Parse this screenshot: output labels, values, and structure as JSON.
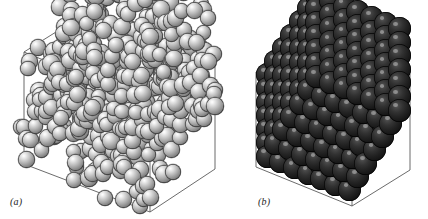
{
  "figure": {
    "background_color": "#ffffff",
    "width": 428,
    "height": 219,
    "caption_style": "italic-serif"
  },
  "panels": [
    {
      "id": "a",
      "label": "(a)",
      "phase": "disordered fluid",
      "sphere_color": "#b4b4b4",
      "sphere_style": "light-gray-specular",
      "box_edge_color": "#555555",
      "arrangement": "random",
      "particle_count": 520,
      "sphere_radius_px": 8.2
    },
    {
      "id": "b",
      "label": "(b)",
      "phase": "ordered crystal",
      "sphere_color": "#1e1e1e",
      "sphere_style": "dark-specular",
      "box_edge_color": "#555555",
      "arrangement": "fcc-lattice",
      "lattice_dimensions": [
        7,
        7,
        7
      ],
      "particle_count": 343,
      "sphere_radius_px": 11.5
    }
  ],
  "chart_data": {
    "type": "scatter",
    "title": "",
    "xlabel": "",
    "ylabel": "",
    "series": [
      {
        "name": "(a) disordered fluid",
        "marker_color": "#b4b4b4",
        "n_points": 520,
        "packing": "random close packing"
      },
      {
        "name": "(b) ordered crystal",
        "marker_color": "#1e1e1e",
        "n_points": 343,
        "packing": "fcc lattice 7x7x7"
      }
    ],
    "legend": "none",
    "grid": false
  }
}
